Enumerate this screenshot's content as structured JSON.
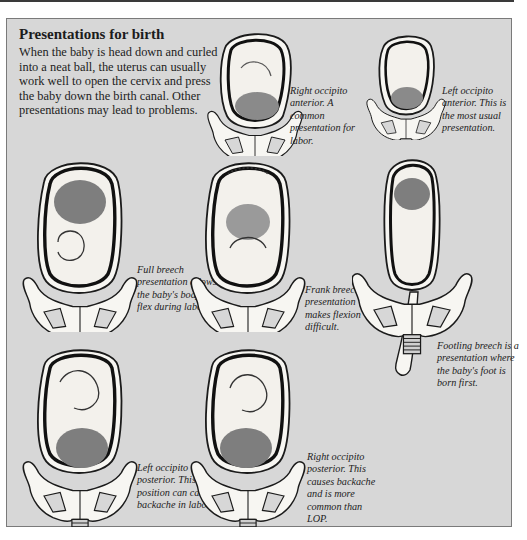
{
  "header": {
    "title": "Presentations for birth",
    "intro": "When the baby is head down and curled into a neat ball, the uterus can usually work well to open the cervix and press the baby down the birth canal. Other presentations may lead to problems."
  },
  "figures": [
    {
      "id": "roa",
      "name": "Right occipito anterior",
      "caption": "Right occipito anterior. A common presentation for labor."
    },
    {
      "id": "loa",
      "name": "Left occipito anterior",
      "caption": "Left occipito anterior. This is the most usual presentation."
    },
    {
      "id": "full-breech",
      "name": "Full breech",
      "caption": "Full breech presentation allows the baby's body to flex during labor."
    },
    {
      "id": "frank-breech",
      "name": "Frank breech",
      "caption": "Frank breech presentation makes flexion difficult."
    },
    {
      "id": "footling-breech",
      "name": "Footling breech",
      "caption": "Footling breech is a presentation where the baby's foot is born first."
    },
    {
      "id": "lop",
      "name": "Left occipito posterior",
      "caption": "Left occipito posterior. This position can cause backache in labor."
    },
    {
      "id": "rop",
      "name": "Right occipito posterior",
      "caption": "Right occipito posterior. This causes backache and is more common than LOP."
    }
  ],
  "colors": {
    "panel": "#d7d7d7",
    "ink": "#1c1c1c",
    "uterus_wall": "#111111",
    "skin": "#f4f2ee"
  }
}
